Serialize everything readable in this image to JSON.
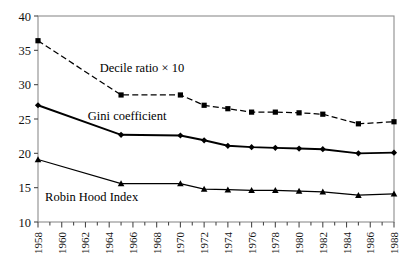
{
  "chart_data": {
    "type": "line",
    "title": "",
    "xlabel": "",
    "ylabel": "",
    "xlim": [
      1958,
      1988
    ],
    "ylim": [
      10,
      40
    ],
    "grid": false,
    "legend_position": "inline-annotations",
    "y_ticks": [
      10,
      15,
      20,
      25,
      30,
      35,
      40
    ],
    "x_ticks": [
      1958,
      1959,
      1960,
      1961,
      1962,
      1963,
      1964,
      1965,
      1966,
      1967,
      1968,
      1969,
      1970,
      1971,
      1972,
      1973,
      1974,
      1975,
      1976,
      1977,
      1978,
      1979,
      1980,
      1981,
      1982,
      1983,
      1984,
      1985,
      1986,
      1987,
      1988
    ],
    "x_tick_labels": [
      "1958",
      "1960",
      "1962",
      "1964",
      "1966",
      "1968",
      "1970",
      "1972",
      "1974",
      "1976",
      "1978",
      "1980",
      "1982",
      "1984",
      "1986",
      "1988"
    ],
    "x_tick_label_years": [
      1958,
      1960,
      1962,
      1964,
      1966,
      1968,
      1970,
      1972,
      1974,
      1976,
      1978,
      1980,
      1982,
      1984,
      1986,
      1988
    ],
    "series": [
      {
        "name": "Decile ratio × 10",
        "marker": "square",
        "linestyle": "dashed",
        "color": "#000000",
        "x": [
          1958,
          1965,
          1970,
          1972,
          1974,
          1976,
          1978,
          1980,
          1982,
          1985,
          1988
        ],
        "values": [
          36.4,
          28.5,
          28.5,
          27.0,
          26.5,
          26.0,
          26.0,
          25.9,
          25.7,
          24.3,
          24.6
        ]
      },
      {
        "name": "Gini coefficient",
        "marker": "diamond",
        "linestyle": "solid",
        "color": "#000000",
        "x": [
          1958,
          1965,
          1970,
          1972,
          1974,
          1976,
          1978,
          1980,
          1982,
          1985,
          1988
        ],
        "values": [
          27.0,
          22.7,
          22.6,
          21.9,
          21.1,
          20.9,
          20.8,
          20.7,
          20.6,
          20.0,
          20.1
        ]
      },
      {
        "name": "Robin Hood Index",
        "marker": "triangle",
        "linestyle": "solid",
        "color": "#000000",
        "x": [
          1958,
          1965,
          1970,
          1972,
          1974,
          1976,
          1978,
          1980,
          1982,
          1985,
          1988
        ],
        "values": [
          19.1,
          15.6,
          15.6,
          14.8,
          14.7,
          14.6,
          14.6,
          14.5,
          14.4,
          13.9,
          14.1
        ]
      }
    ],
    "annotations": [
      {
        "text": "Decile ratio × 10",
        "x": 1963.2,
        "y": 31.9
      },
      {
        "text": "Gini coefficient",
        "x": 1962.2,
        "y": 24.8
      },
      {
        "text": "Robin Hood Index",
        "x": 1958.6,
        "y": 13.1
      }
    ]
  }
}
